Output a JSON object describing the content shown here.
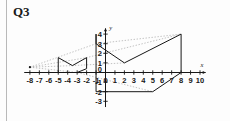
{
  "page": {
    "title": "Q3",
    "background": "#fdfdfd"
  },
  "chart_data": {
    "type": "scatter",
    "title": "Q3",
    "xlabel": "x",
    "ylabel": "y",
    "xlim": [
      -8.6,
      10.6
    ],
    "ylim": [
      -3.6,
      4.6
    ],
    "grid": false,
    "legend_position": "none",
    "x_ticks": [
      -8,
      -7,
      -6,
      -5,
      -4,
      -3,
      -2,
      -1,
      0,
      1,
      2,
      3,
      4,
      5,
      6,
      7,
      8,
      9,
      10
    ],
    "x_tick_labels": [
      "-8",
      "-7",
      "-6",
      "-5",
      "-4",
      "-3",
      "-2",
      "-1",
      "0",
      "1",
      "2",
      "3",
      "4",
      "5",
      "6",
      "7",
      "8",
      "9",
      "10"
    ],
    "y_ticks": [
      -3,
      -2,
      -1,
      0,
      1,
      2,
      3,
      4
    ],
    "y_tick_labels": [
      "-3",
      "-2",
      "-1",
      "0",
      "1",
      "2",
      "3",
      "4"
    ],
    "axis_color": "#171717",
    "shape_color": "#171717",
    "ray_color": "#a8a8a8",
    "series": [
      {
        "name": "small-arrow-shape",
        "style": "solid-polygon",
        "points": [
          [
            -5,
            0
          ],
          [
            -5,
            1.55
          ],
          [
            -3.5,
            0.72
          ],
          [
            -2,
            1.55
          ],
          [
            -2,
            0.4
          ],
          [
            -3,
            0
          ]
        ]
      },
      {
        "name": "large-arrow-shape",
        "style": "solid-polygon",
        "points": [
          [
            -1,
            4
          ],
          [
            -1,
            3
          ],
          [
            2,
            1
          ],
          [
            8,
            4
          ],
          [
            8,
            0
          ],
          [
            5,
            -2
          ],
          [
            -1,
            -2
          ]
        ]
      },
      {
        "name": "enlargement-ray-upper",
        "style": "dotted-line",
        "points": [
          [
            -8,
            0.55
          ],
          [
            -1,
            3
          ],
          [
            8,
            4
          ]
        ]
      },
      {
        "name": "enlargement-ray-middle",
        "style": "dotted-line",
        "points": [
          [
            -8,
            0.55
          ],
          [
            -3.5,
            0.72
          ],
          [
            2,
            1
          ]
        ]
      },
      {
        "name": "enlargement-ray-lower",
        "style": "dotted-line",
        "points": [
          [
            -8,
            0.55
          ],
          [
            -3,
            0
          ],
          [
            5,
            -2
          ]
        ]
      },
      {
        "name": "enlargement-ray-vertex",
        "style": "dotted-line",
        "points": [
          [
            -8,
            0.55
          ],
          [
            -2,
            1.55
          ],
          [
            8,
            4
          ]
        ]
      },
      {
        "name": "center-of-enlargement",
        "style": "point",
        "points": [
          [
            -8,
            0.55
          ]
        ]
      }
    ],
    "annotations": [
      {
        "name": "y-axis-label",
        "text": "y",
        "x": 0.55,
        "y": 4.45
      },
      {
        "name": "x-axis-label",
        "text": "x",
        "x": 10.2,
        "y": 0.62
      }
    ]
  }
}
